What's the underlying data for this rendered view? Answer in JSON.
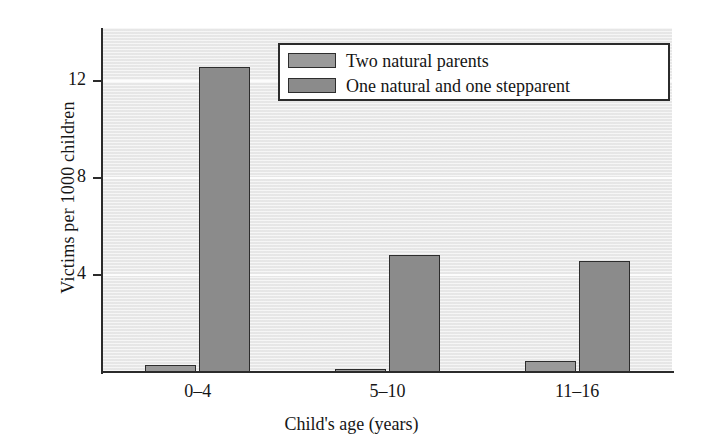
{
  "chart_data": {
    "type": "bar",
    "title": "",
    "xlabel": "Child's age (years)",
    "ylabel": "Victims per 1000 children",
    "categories": [
      "0–4",
      "5–10",
      "11–16"
    ],
    "series": [
      {
        "name": "Two natural parents",
        "color": "#9a9a9a",
        "values": [
          0.3,
          0.12,
          0.45
        ]
      },
      {
        "name": "One natural and one stepparent",
        "color": "#8b8b8b",
        "values": [
          12.6,
          4.85,
          4.6
        ]
      }
    ],
    "yticks": [
      4,
      8,
      12
    ],
    "ytick_labels": [
      "4",
      "8",
      "12"
    ],
    "ylim": [
      0,
      14.2
    ],
    "grid": true,
    "gridline_color": "#fdfdfd",
    "plot_background": "#ebebeb",
    "legend_position": "top-right",
    "axis_color": "#2b2b2b"
  }
}
